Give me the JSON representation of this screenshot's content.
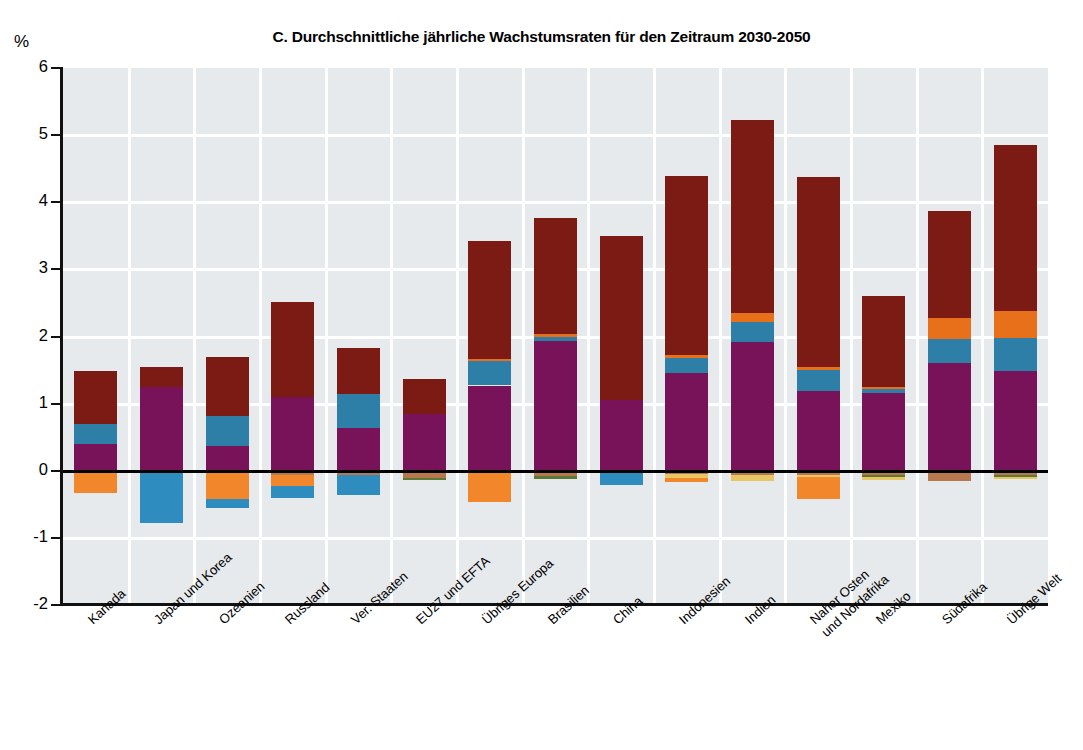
{
  "axis": {
    "unit_label": "%",
    "y_ticks": [
      "6",
      "5",
      "4",
      "3",
      "2",
      "1",
      "0",
      "-1",
      "-2"
    ],
    "y_min": -2,
    "y_max": 6
  },
  "chart_data": {
    "type": "bar",
    "title": "C. Durchschnittliche jährliche Wachstumsraten für den Zeitraum 2030-2050",
    "xlabel": "",
    "ylabel": "%",
    "ylim": [
      -2,
      6
    ],
    "grid": true,
    "stacked": true,
    "legend_position": "none",
    "categories": [
      "Kanada",
      "Japan und Korea",
      "Ozeanien",
      "Russland",
      "Ver. Staaten",
      "EU27 und EFTA",
      "Übriges Europa",
      "Brasilien",
      "China",
      "Indonesien",
      "Indien",
      "Naher Osten\nund Nordafrika",
      "Mexiko",
      "Südafrika",
      "Übrige Welt"
    ],
    "series": [
      {
        "name": "purple",
        "color": "#78135A",
        "values": [
          0.4,
          1.25,
          0.37,
          1.1,
          0.64,
          0.84,
          1.27,
          1.93,
          1.05,
          1.46,
          1.92,
          1.19,
          1.16,
          1.61,
          1.48
        ]
      },
      {
        "name": "blue",
        "color": "#2E7FA8",
        "values": [
          0.29,
          0.0,
          0.44,
          0.0,
          0.51,
          0.0,
          0.36,
          0.06,
          0.0,
          0.22,
          0.3,
          0.31,
          0.06,
          0.36,
          0.5
        ]
      },
      {
        "name": "orange",
        "color": "#E8701A",
        "values": [
          0.0,
          0.0,
          0.0,
          0.0,
          0.0,
          0.0,
          0.03,
          0.04,
          0.0,
          0.05,
          0.13,
          0.05,
          0.03,
          0.3,
          0.4
        ]
      },
      {
        "name": "dark-red",
        "color": "#7B1B13",
        "values": [
          0.8,
          0.3,
          0.88,
          1.41,
          0.68,
          0.52,
          1.76,
          1.73,
          2.45,
          2.66,
          2.87,
          2.82,
          1.35,
          1.6,
          2.48
        ]
      },
      {
        "name": "neg-orange",
        "color": "#F2862B",
        "values": [
          -0.33,
          0.0,
          -0.42,
          -0.16,
          0.0,
          0.0,
          -0.46,
          0.0,
          0.0,
          -0.06,
          0.0,
          -0.32,
          0.0,
          0.0,
          0.0
        ]
      },
      {
        "name": "neg-blue",
        "color": "#2E8DBE",
        "values": [
          0.0,
          -0.78,
          -0.13,
          -0.17,
          -0.29,
          0.0,
          0.0,
          0.0,
          -0.21,
          0.0,
          0.0,
          0.0,
          0.0,
          0.0,
          0.0
        ]
      },
      {
        "name": "neg-brown",
        "color": "#B9774F",
        "values": [
          0.0,
          0.0,
          0.0,
          -0.07,
          -0.07,
          -0.11,
          0.0,
          -0.08,
          0.0,
          -0.05,
          -0.07,
          -0.06,
          -0.06,
          -0.16,
          -0.06
        ]
      },
      {
        "name": "neg-green",
        "color": "#5C7A35",
        "values": [
          0.0,
          0.0,
          0.0,
          0.0,
          0.0,
          -0.03,
          0.0,
          -0.04,
          0.0,
          0.0,
          0.0,
          0.0,
          -0.03,
          0.0,
          -0.03
        ]
      },
      {
        "name": "neg-yellow",
        "color": "#E8C662",
        "values": [
          0.0,
          0.0,
          0.0,
          0.0,
          0.0,
          0.0,
          0.0,
          0.0,
          0.0,
          -0.06,
          -0.08,
          -0.04,
          -0.05,
          0.0,
          -0.03
        ]
      }
    ],
    "totals_positive": [
      1.49,
      1.55,
      1.69,
      2.51,
      1.83,
      1.36,
      3.42,
      3.76,
      3.5,
      4.39,
      5.22,
      4.37,
      2.6,
      3.87,
      4.86
    ],
    "totals_negative": [
      -0.33,
      -0.78,
      -0.55,
      -0.4,
      -0.36,
      -0.14,
      -0.46,
      -0.12,
      -0.21,
      -0.17,
      -0.15,
      -0.42,
      -0.14,
      -0.16,
      -0.12
    ]
  }
}
